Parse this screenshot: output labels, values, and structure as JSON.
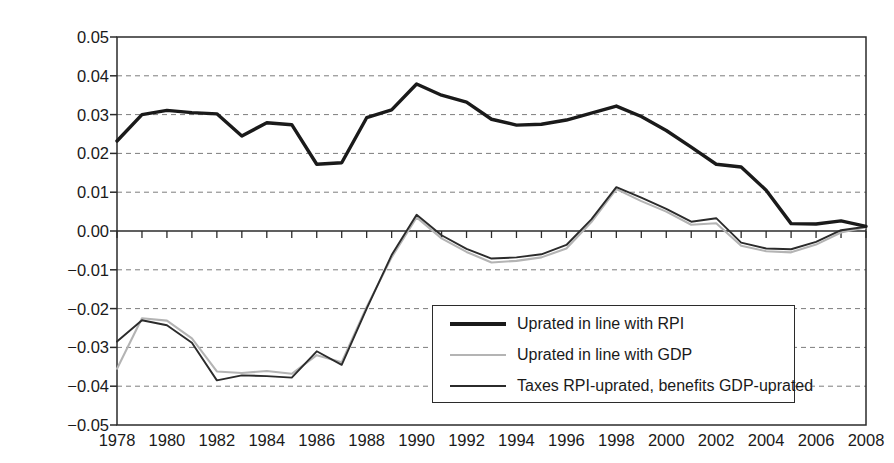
{
  "chart_data": {
    "type": "line",
    "title": "",
    "xlabel": "",
    "ylabel": "Increase in Gini relative to 2008–09",
    "xlim": [
      1978,
      2008
    ],
    "ylim": [
      -0.05,
      0.05
    ],
    "grid": true,
    "legend_position": "inside-bottom-right",
    "x": [
      1978,
      1979,
      1980,
      1981,
      1982,
      1983,
      1984,
      1985,
      1986,
      1987,
      1988,
      1989,
      1990,
      1991,
      1992,
      1993,
      1994,
      1995,
      1996,
      1997,
      1998,
      1999,
      2000,
      2001,
      2002,
      2003,
      2004,
      2005,
      2006,
      2007,
      2008
    ],
    "xtick_labels": [
      "1978",
      "1980",
      "1982",
      "1984",
      "1986",
      "1988",
      "1990",
      "1992",
      "1994",
      "1996",
      "1998",
      "2000",
      "2002",
      "2004",
      "2006",
      "2008"
    ],
    "ytick_labels": [
      "0.05",
      "0.04",
      "0.03",
      "0.02",
      "0.01",
      "0.00",
      "−0.01",
      "−0.02",
      "−0.03",
      "−0.04",
      "−0.05"
    ],
    "ytick_values": [
      0.05,
      0.04,
      0.03,
      0.02,
      0.01,
      0.0,
      -0.01,
      -0.02,
      -0.03,
      -0.04,
      -0.05
    ],
    "series": [
      {
        "name": "Uprated in line with RPI",
        "color": "#1a1a1a",
        "width": 3.4,
        "values": [
          0.0232,
          0.03,
          0.0311,
          0.0305,
          0.0302,
          0.0245,
          0.0279,
          0.0274,
          0.0172,
          0.0176,
          0.0292,
          0.0312,
          0.0379,
          0.035,
          0.0332,
          0.0288,
          0.0273,
          0.0275,
          0.0286,
          0.0304,
          0.0322,
          0.0295,
          0.0259,
          0.0216,
          0.0172,
          0.0165,
          0.0105,
          0.0019,
          0.0018,
          0.0026,
          0.0012
        ]
      },
      {
        "name": "Uprated in line with GDP",
        "color": "#b4b4b4",
        "width": 2.1,
        "values": [
          -0.0355,
          -0.0225,
          -0.0231,
          -0.0277,
          -0.0362,
          -0.0366,
          -0.0361,
          -0.0368,
          -0.032,
          -0.0338,
          -0.0196,
          -0.0068,
          0.0035,
          -0.0019,
          -0.0054,
          -0.0081,
          -0.0077,
          -0.0068,
          -0.0045,
          0.0023,
          0.0108,
          0.0077,
          0.005,
          0.0016,
          0.002,
          -0.0038,
          -0.0052,
          -0.0055,
          -0.0035,
          -0.0004,
          0.001
        ]
      },
      {
        "name": "Taxes RPI-uprated, benefits GDP-uprated",
        "color": "#2b2b2b",
        "width": 1.9,
        "values": [
          -0.0285,
          -0.023,
          -0.0243,
          -0.0288,
          -0.0385,
          -0.0372,
          -0.0374,
          -0.0378,
          -0.031,
          -0.0345,
          -0.02,
          -0.0062,
          0.0042,
          -0.0011,
          -0.0046,
          -0.0071,
          -0.0068,
          -0.006,
          -0.0036,
          0.003,
          0.0113,
          0.0086,
          0.0057,
          0.0024,
          0.0033,
          -0.003,
          -0.0045,
          -0.0047,
          -0.0028,
          0.0002,
          0.0011
        ]
      }
    ]
  },
  "axes": {
    "plot_left": 117,
    "plot_right": 866,
    "plot_top": 37,
    "plot_bottom": 425,
    "zero_y": 231
  },
  "legend": {
    "items": [
      {
        "label": "Uprated in line with RPI",
        "color": "#1a1a1a",
        "width": 3.4
      },
      {
        "label": "Uprated in line with GDP",
        "color": "#b4b4b4",
        "width": 2.1
      },
      {
        "label": "Taxes RPI-uprated, benefits GDP-uprated",
        "color": "#2b2b2b",
        "width": 1.9
      }
    ]
  }
}
